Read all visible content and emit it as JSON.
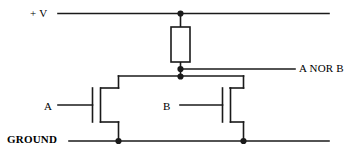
{
  "diagram": {
    "type": "schematic",
    "colors": {
      "wire": "#1a1a1a",
      "background": "#ffffff",
      "text": "#000000"
    },
    "labels": {
      "supply": "+ V",
      "output": "A NOR B",
      "input_a": "A",
      "input_b": "B",
      "ground": "GROUND"
    },
    "components": [
      {
        "name": "pull-up-resistor",
        "shape": "rectangle"
      },
      {
        "name": "transistor-a",
        "shape": "mosfet"
      },
      {
        "name": "transistor-b",
        "shape": "mosfet"
      }
    ],
    "nodes": [
      {
        "name": "supply-junction"
      },
      {
        "name": "output-junction"
      },
      {
        "name": "drain-junction"
      },
      {
        "name": "ground-junction-a"
      },
      {
        "name": "ground-junction-b"
      }
    ]
  }
}
